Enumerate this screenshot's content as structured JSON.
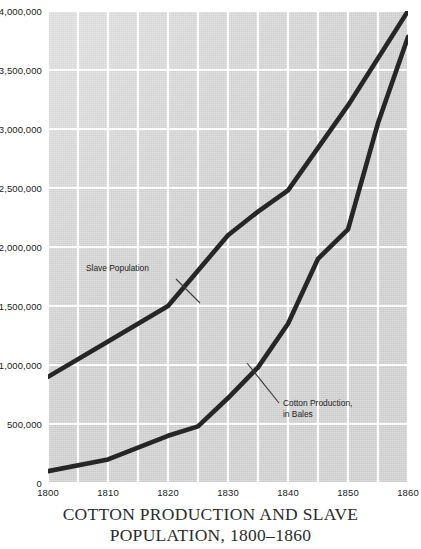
{
  "caption": {
    "line1": "COTTON PRODUCTION AND SLAVE",
    "line2": "POPULATION, 1800–1860"
  },
  "annotations": {
    "slave": "Slave Population",
    "cotton_line1": "Cotton Production,",
    "cotton_line2": "in Bales"
  },
  "colors": {
    "plot_background": "#d2d2d2",
    "gridline": "#ffffff",
    "series_line": "#262626",
    "text": "#1a1a1a",
    "caption_text": "#2b2b2b"
  },
  "chart_data": {
    "type": "line",
    "title": "COTTON PRODUCTION AND SLAVE POPULATION, 1800–1860",
    "xlabel": "",
    "ylabel": "",
    "xlim": [
      1800,
      1860
    ],
    "ylim": [
      0,
      4000000
    ],
    "grid": true,
    "legend_position": "inline-annotations",
    "x_ticks": [
      1800,
      1810,
      1820,
      1830,
      1840,
      1850,
      1860
    ],
    "x_tick_labels": [
      "1800",
      "1810",
      "1820",
      "1830",
      "1840",
      "1850",
      "1860"
    ],
    "x_minor_gridlines": [
      1805,
      1815,
      1825,
      1835,
      1845,
      1855
    ],
    "y_ticks": [
      0,
      500000,
      1000000,
      1500000,
      2000000,
      2500000,
      3000000,
      3500000,
      4000000
    ],
    "y_tick_labels": [
      "0",
      "500,000",
      "1,000,000",
      "1,500,000",
      "2,000,000",
      "2,500,000",
      "3,000,000",
      "3,500,000",
      "4,000,000"
    ],
    "series": [
      {
        "name": "Slave Population",
        "x": [
          1800,
          1810,
          1820,
          1830,
          1835,
          1840,
          1850,
          1860
        ],
        "values": [
          900000,
          1200000,
          1500000,
          2100000,
          2300000,
          2480000,
          3200000,
          4000000
        ]
      },
      {
        "name": "Cotton Production, in Bales",
        "x": [
          1800,
          1810,
          1820,
          1825,
          1830,
          1835,
          1840,
          1845,
          1850,
          1855,
          1860
        ],
        "values": [
          100000,
          200000,
          400000,
          480000,
          720000,
          980000,
          1350000,
          1900000,
          2150000,
          3050000,
          3780000
        ]
      }
    ]
  }
}
